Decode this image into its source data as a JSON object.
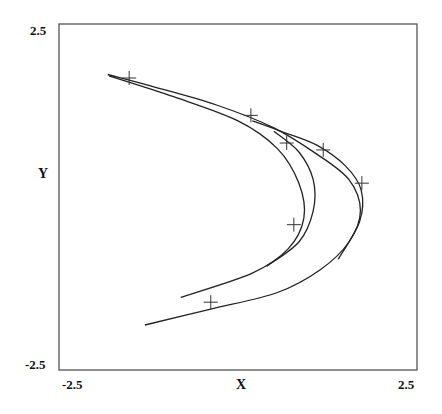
{
  "chart_data": {
    "type": "line",
    "title": "",
    "xlabel": "X",
    "ylabel": "Y",
    "xlim": [
      -2.5,
      2.5
    ],
    "ylim": [
      -2.5,
      2.5
    ],
    "grid": false,
    "legend": null,
    "x_ticks": [
      "-2.5",
      "2.5"
    ],
    "y_ticks": [
      "2.5",
      "-2.5"
    ],
    "series": [
      {
        "name": "attractor-outer",
        "points": [
          [
            -1.82,
            1.77
          ],
          [
            -1.2,
            1.6
          ],
          [
            -0.3,
            1.33
          ],
          [
            0.5,
            1.0
          ],
          [
            1.1,
            0.62
          ],
          [
            1.55,
            0.25
          ],
          [
            1.71,
            -0.2
          ],
          [
            1.55,
            -0.65
          ],
          [
            1.15,
            -1.05
          ],
          [
            0.55,
            -1.38
          ],
          [
            -0.38,
            -1.62
          ],
          [
            -1.3,
            -1.85
          ]
        ]
      },
      {
        "name": "attractor-inner",
        "points": [
          [
            -1.8,
            1.75
          ],
          [
            -0.9,
            1.45
          ],
          [
            0.0,
            1.1
          ],
          [
            0.55,
            0.7
          ],
          [
            0.85,
            0.2
          ],
          [
            0.92,
            -0.3
          ],
          [
            0.7,
            -0.75
          ],
          [
            0.2,
            -1.1
          ],
          [
            -0.8,
            -1.45
          ]
        ]
      },
      {
        "name": "attractor-fold",
        "points": [
          [
            0.2,
            1.1
          ],
          [
            0.6,
            0.95
          ],
          [
            1.1,
            0.75
          ],
          [
            1.5,
            0.45
          ],
          [
            1.72,
            0.1
          ],
          [
            1.7,
            -0.35
          ],
          [
            1.4,
            -0.9
          ]
        ]
      },
      {
        "name": "attractor-inner2",
        "points": [
          [
            0.5,
            0.95
          ],
          [
            0.85,
            0.65
          ],
          [
            1.05,
            0.25
          ],
          [
            1.05,
            -0.2
          ],
          [
            0.85,
            -0.65
          ],
          [
            0.4,
            -1.0
          ]
        ]
      }
    ],
    "markers": [
      {
        "x": -1.52,
        "y": 1.72
      },
      {
        "x": 0.18,
        "y": 1.18
      },
      {
        "x": 0.68,
        "y": 0.78
      },
      {
        "x": 1.19,
        "y": 0.68
      },
      {
        "x": 1.73,
        "y": 0.2
      },
      {
        "x": 0.78,
        "y": -0.4
      },
      {
        "x": -0.38,
        "y": -1.52
      }
    ]
  },
  "axes": {
    "x_min_label": "-2.5",
    "x_max_label": "2.5",
    "y_max_label": "2.5",
    "y_min_label": "-2.5",
    "x_label": "X",
    "y_label": "Y"
  }
}
